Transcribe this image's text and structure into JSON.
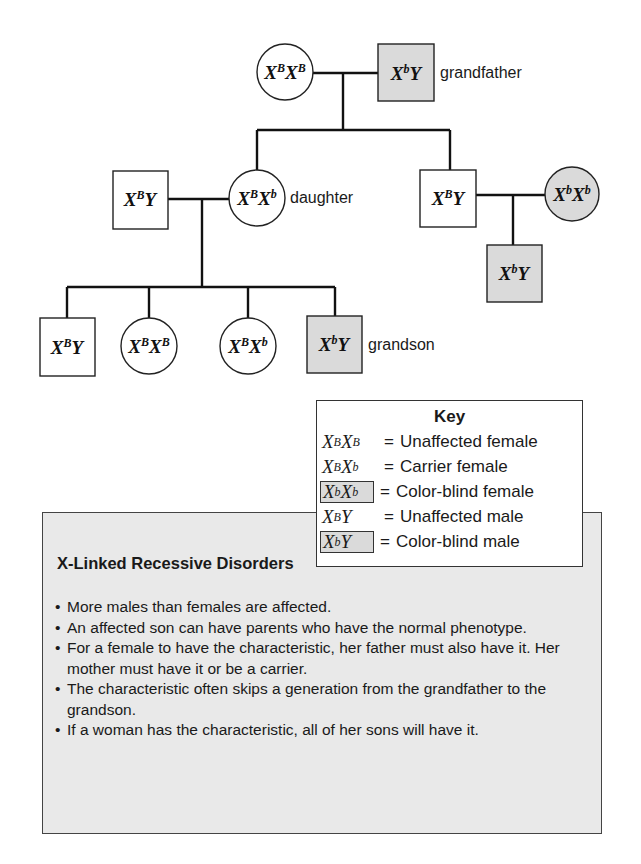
{
  "pedigree": {
    "grandmother": {
      "base1": "X",
      "sup1": "B",
      "base2": "X",
      "sup2": "B",
      "sex": "female",
      "affected": false
    },
    "grandfather": {
      "base1": "X",
      "sup1": "b",
      "base2": "Y",
      "sex": "male",
      "affected": true,
      "label": "grandfather"
    },
    "daughter_husband": {
      "base1": "X",
      "sup1": "B",
      "base2": "Y",
      "sex": "male",
      "affected": false
    },
    "daughter": {
      "base1": "X",
      "sup1": "B",
      "base2": "X",
      "sup2": "b",
      "sex": "female",
      "affected": false,
      "label": "daughter"
    },
    "son": {
      "base1": "X",
      "sup1": "B",
      "base2": "Y",
      "sex": "male",
      "affected": false
    },
    "son_wife": {
      "base1": "X",
      "sup1": "b",
      "base2": "X",
      "sup2": "b",
      "sex": "female",
      "affected": true
    },
    "son_child": {
      "base1": "X",
      "sup1": "b",
      "base2": "Y",
      "sex": "male",
      "affected": true
    },
    "grandchildren": [
      {
        "base1": "X",
        "sup1": "B",
        "base2": "Y",
        "sex": "male",
        "affected": false
      },
      {
        "base1": "X",
        "sup1": "B",
        "base2": "X",
        "sup2": "B",
        "sex": "female",
        "affected": false
      },
      {
        "base1": "X",
        "sup1": "B",
        "base2": "X",
        "sup2": "b",
        "sex": "female",
        "affected": false
      },
      {
        "base1": "X",
        "sup1": "b",
        "base2": "Y",
        "sex": "male",
        "affected": true,
        "label": "grandson"
      }
    ]
  },
  "key": {
    "title": "Key",
    "equals": "=",
    "rows": [
      {
        "b1": "X",
        "s1": "B",
        "b2": "X",
        "s2": "B",
        "desc": "Unaffected female",
        "boxed": false
      },
      {
        "b1": "X",
        "s1": "B",
        "b2": "X",
        "s2": "b",
        "desc": "Carrier female",
        "boxed": false
      },
      {
        "b1": "X",
        "s1": "b",
        "b2": "X",
        "s2": "b",
        "desc": "Color-blind female",
        "boxed": true
      },
      {
        "b1": "X",
        "s1": "B",
        "b2": "Y",
        "s2": "",
        "desc": "Unaffected male",
        "boxed": false
      },
      {
        "b1": "X",
        "s1": "b",
        "b2": "Y",
        "s2": "",
        "desc": "Color-blind male",
        "boxed": true
      }
    ]
  },
  "info": {
    "title": "X-Linked Recessive Disorders",
    "bullets": [
      "More males than females are affected.",
      "An affected son can have parents who have the normal phenotype.",
      "For a female to have the characteristic, her father must also have it. Her mother must have it or be a carrier.",
      "The characteristic often skips a generation from the grandfather to the grandson.",
      "If a woman has the characteristic, all of her sons will have it."
    ]
  },
  "colors": {
    "affected_fill": "#dadada",
    "unaffected_fill": "#ffffff",
    "info_box_fill": "#e9e9e9"
  }
}
